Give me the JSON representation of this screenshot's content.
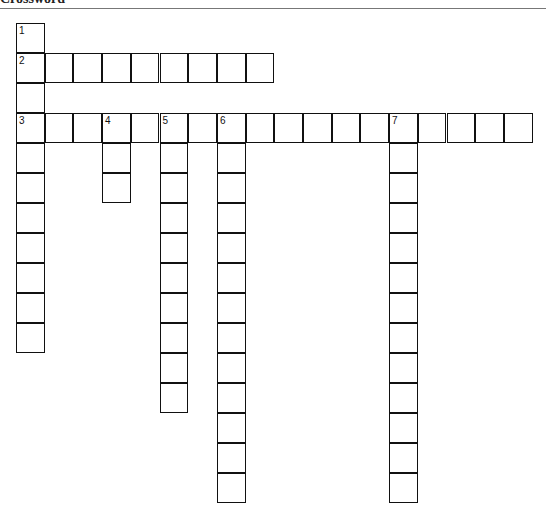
{
  "title": "Crossword",
  "grid": {
    "left": 16,
    "top": 23,
    "cell_w": 28.7,
    "cell_h": 30
  },
  "entries": [
    {
      "number": "1",
      "dir": "down",
      "row": 0,
      "col": 0,
      "length": 11
    },
    {
      "number": "2",
      "dir": "across",
      "row": 1,
      "col": 0,
      "length": 9
    },
    {
      "number": "3",
      "dir": "across",
      "row": 3,
      "col": 0,
      "length": 18
    },
    {
      "number": "4",
      "dir": "down",
      "row": 3,
      "col": 3,
      "length": 3
    },
    {
      "number": "5",
      "dir": "down",
      "row": 3,
      "col": 5,
      "length": 10
    },
    {
      "number": "6",
      "dir": "down",
      "row": 3,
      "col": 7,
      "length": 13
    },
    {
      "number": "7",
      "dir": "down",
      "row": 3,
      "col": 13,
      "length": 13
    }
  ]
}
